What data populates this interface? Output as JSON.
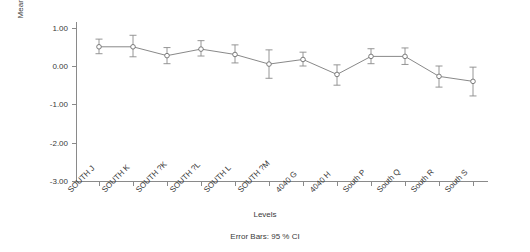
{
  "chart_data": {
    "type": "line",
    "title": "",
    "subtitle": "",
    "xlabel": "Levels",
    "ylabel": "Mean Logged density CountL",
    "categories": [
      "SOUTH J",
      "SOUTH K",
      "SOUTH ?K",
      "SOUTH ?L",
      "SOUTH L",
      "SOUTH ?M",
      "4040 G",
      "4040 H",
      "South P",
      "South Q",
      "South R",
      "South S"
    ],
    "values": [
      0.5,
      0.5,
      0.27,
      0.44,
      0.3,
      0.05,
      0.17,
      -0.22,
      0.25,
      0.25,
      -0.27,
      -0.4
    ],
    "error_upper": [
      0.7,
      0.8,
      0.48,
      0.66,
      0.55,
      0.42,
      0.36,
      0.03,
      0.45,
      0.47,
      0.0,
      -0.03
    ],
    "error_lower": [
      0.32,
      0.24,
      0.06,
      0.26,
      0.08,
      -0.32,
      0.0,
      -0.5,
      0.06,
      0.04,
      -0.55,
      -0.78
    ],
    "error_type": "95 % CI",
    "error_caption": "Error Bars: 95 % CI",
    "ylim": [
      -3.25,
      1.35
    ],
    "yticks": [
      1.0,
      0.0,
      -1.0,
      -2.0,
      -3.0
    ],
    "ytick_labels": [
      "1.00",
      "0.00",
      "-1.00",
      "-2.00",
      "-3.00"
    ],
    "grid": false,
    "legend": false,
    "marker": "open-circle",
    "line_color": "#7a7a7a",
    "marker_color": "#6e6e6e",
    "error_color": "#8a8a8a",
    "axis_color": "#8a8a8a",
    "text_color": "#3a3a3a"
  }
}
